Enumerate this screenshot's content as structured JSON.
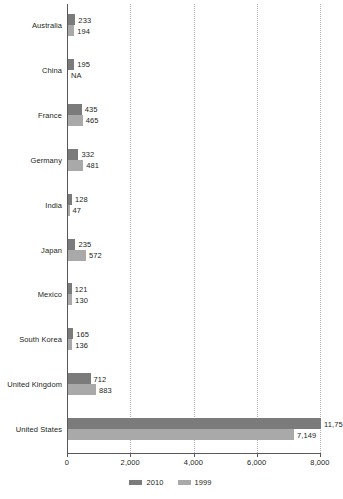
{
  "chart_data": {
    "type": "bar",
    "orientation": "horizontal",
    "title": "",
    "subtitle": "",
    "xlabel": "",
    "ylabel": "",
    "xlim": [
      0,
      8000
    ],
    "xticks": [
      0,
      2000,
      4000,
      6000,
      8000
    ],
    "xtick_labels": [
      "0",
      "2,000",
      "4,000",
      "6,000",
      "8,000"
    ],
    "grid": "vertical-dotted",
    "legend_position": "bottom-center",
    "categories": [
      "Australia",
      "China",
      "France",
      "Germany",
      "India",
      "Japan",
      "Mexico",
      "South Korea",
      "United Kingdom",
      "United States"
    ],
    "series": [
      {
        "name": "2010",
        "color": "#7b7b7b",
        "values": [
          233,
          195,
          435,
          332,
          128,
          235,
          121,
          165,
          712,
          11750
        ],
        "labels": [
          "233",
          "195",
          "435",
          "332",
          "128",
          "235",
          "121",
          "165",
          "712",
          "11,75"
        ]
      },
      {
        "name": "1999",
        "color": "#a9a9a9",
        "values": [
          194,
          null,
          465,
          481,
          47,
          572,
          130,
          136,
          883,
          7149
        ],
        "labels": [
          "194",
          "NA",
          "465",
          "481",
          "47",
          "572",
          "130",
          "136",
          "883",
          "7,149"
        ]
      }
    ]
  },
  "legend": {
    "items": [
      {
        "label": "2010",
        "color": "#7b7b7b"
      },
      {
        "label": "1999",
        "color": "#a9a9a9"
      }
    ]
  },
  "axis": {
    "tick_labels": [
      "0",
      "2,000",
      "4,000",
      "6,000",
      "8,000"
    ]
  }
}
